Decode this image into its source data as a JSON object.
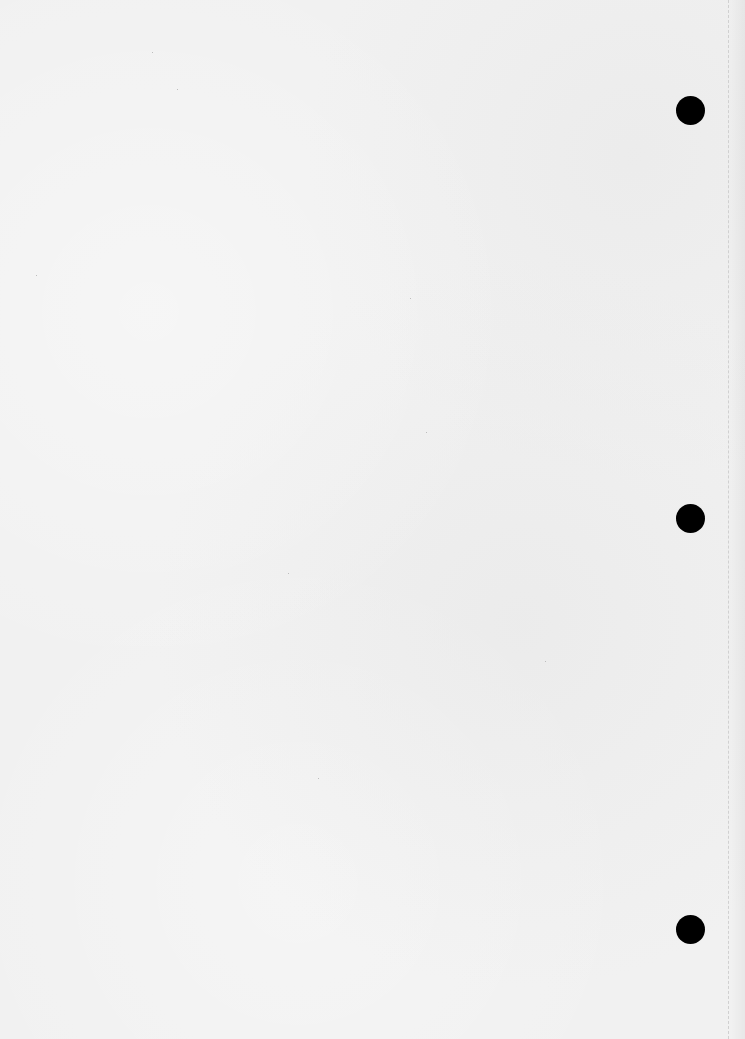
{
  "document": {
    "type": "blank-hole-punched-paper",
    "text": "",
    "background_color": "#f1f1f1",
    "punch_holes": [
      {
        "cx": 690,
        "cy": 110,
        "diameter": 29,
        "color": "#000000"
      },
      {
        "cx": 690,
        "cy": 518,
        "diameter": 29,
        "color": "#000000"
      },
      {
        "cx": 690,
        "cy": 929,
        "diameter": 29,
        "color": "#000000"
      }
    ],
    "perforation_line": {
      "x": 728,
      "style": "dashed",
      "color": "#c9c9c9"
    }
  }
}
